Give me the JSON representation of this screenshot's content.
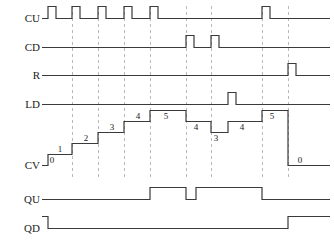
{
  "diagram": {
    "type": "timing-diagram",
    "title": "",
    "width": 334,
    "height": 243,
    "colors": {
      "signal": "#3a3a3a",
      "grid": "#b9b9b9",
      "text": "#222222",
      "background": "#ffffff"
    },
    "time_axis": {
      "x_start": 42,
      "x_end": 330,
      "gridlines_x": [
        72,
        98,
        124,
        150,
        186,
        211,
        262,
        288
      ]
    },
    "signals": [
      {
        "name": "CU",
        "label": "CU",
        "baseline_y": 18,
        "amplitude": 12,
        "kind": "digital",
        "edges": [
          {
            "x": 48,
            "level": 1
          },
          {
            "x": 56,
            "level": 0
          },
          {
            "x": 72,
            "level": 1
          },
          {
            "x": 80,
            "level": 0
          },
          {
            "x": 98,
            "level": 1
          },
          {
            "x": 106,
            "level": 0
          },
          {
            "x": 124,
            "level": 1
          },
          {
            "x": 132,
            "level": 0
          },
          {
            "x": 150,
            "level": 1
          },
          {
            "x": 158,
            "level": 0
          },
          {
            "x": 262,
            "level": 1
          },
          {
            "x": 270,
            "level": 0
          }
        ],
        "pulse_count": 6
      },
      {
        "name": "CD",
        "label": "CD",
        "baseline_y": 47,
        "amplitude": 12,
        "kind": "digital",
        "edges": [
          {
            "x": 186,
            "level": 1
          },
          {
            "x": 194,
            "level": 0
          },
          {
            "x": 211,
            "level": 1
          },
          {
            "x": 219,
            "level": 0
          }
        ],
        "pulse_count": 2
      },
      {
        "name": "R",
        "label": "R",
        "baseline_y": 75,
        "amplitude": 12,
        "kind": "digital",
        "edges": [
          {
            "x": 288,
            "level": 1
          },
          {
            "x": 296,
            "level": 0
          }
        ],
        "pulse_count": 1
      },
      {
        "name": "LD",
        "label": "LD",
        "baseline_y": 104,
        "amplitude": 12,
        "kind": "digital",
        "edges": [
          {
            "x": 228,
            "level": 1
          },
          {
            "x": 236,
            "level": 0
          }
        ],
        "pulse_count": 1
      },
      {
        "name": "QU",
        "label": "QU",
        "baseline_y": 199,
        "amplitude": 12,
        "kind": "digital",
        "edges": [
          {
            "x": 150,
            "level": 1
          },
          {
            "x": 186,
            "level": 0
          },
          {
            "x": 196,
            "level": 1
          },
          {
            "x": 262,
            "level": 0
          }
        ],
        "pulse_count": 2
      },
      {
        "name": "QD",
        "label": "QD",
        "baseline_y": 228,
        "amplitude": 12,
        "kind": "digital",
        "initial_level": 1,
        "edges": [
          {
            "x": 48,
            "level": 0
          },
          {
            "x": 288,
            "level": 1
          }
        ],
        "pulse_count": 1
      }
    ],
    "counter_value": {
      "name": "CV",
      "label": "CV",
      "baseline_y": 165,
      "step_height": 11,
      "steps": [
        {
          "x_start": 42,
          "x_end": 48,
          "value": 0,
          "label": "0",
          "label_x": 52,
          "label_y": 163
        },
        {
          "x_start": 48,
          "x_end": 72,
          "value": 1,
          "label": "1",
          "label_x": 60,
          "label_y": 152
        },
        {
          "x_start": 72,
          "x_end": 98,
          "value": 2,
          "label": "2",
          "label_x": 86,
          "label_y": 141
        },
        {
          "x_start": 98,
          "x_end": 124,
          "value": 3,
          "label": "3",
          "label_x": 112,
          "label_y": 130
        },
        {
          "x_start": 124,
          "x_end": 150,
          "value": 4,
          "label": "4",
          "label_x": 138,
          "label_y": 119
        },
        {
          "x_start": 150,
          "x_end": 186,
          "value": 5,
          "label": "5",
          "label_x": 166,
          "label_y": 119
        },
        {
          "x_start": 186,
          "x_end": 211,
          "value": 4,
          "label": "4",
          "label_x": 196,
          "label_y": 130
        },
        {
          "x_start": 211,
          "x_end": 228,
          "value": 3,
          "label": "3",
          "label_x": 216,
          "label_y": 141
        },
        {
          "x_start": 228,
          "x_end": 262,
          "value": 4,
          "label": "4",
          "label_x": 242,
          "label_y": 130
        },
        {
          "x_start": 262,
          "x_end": 288,
          "value": 5,
          "label": "5",
          "label_x": 272,
          "label_y": 119
        },
        {
          "x_start": 288,
          "x_end": 330,
          "value": 0,
          "label": "0",
          "label_x": 300,
          "label_y": 163
        }
      ],
      "value_sequence": [
        0,
        1,
        2,
        3,
        4,
        5,
        4,
        3,
        4,
        5,
        0
      ],
      "min": 0,
      "max": 5
    }
  }
}
